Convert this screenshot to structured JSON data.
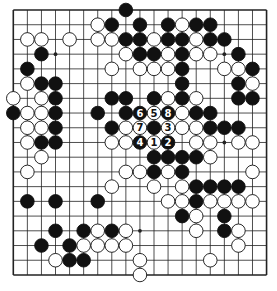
{
  "diagram": {
    "type": "go-board",
    "size": 19,
    "colors": {
      "line": "#222222",
      "black_stone": "#111111",
      "white_stone": "#ffffff",
      "background": "#ffffff"
    },
    "hoshi": [
      [
        3,
        3
      ],
      [
        3,
        9
      ],
      [
        3,
        15
      ],
      [
        9,
        3
      ],
      [
        9,
        9
      ],
      [
        9,
        15
      ],
      [
        15,
        3
      ],
      [
        15,
        9
      ],
      [
        15,
        15
      ]
    ],
    "stones": [
      {
        "r": 0,
        "c": 8,
        "color": "B"
      },
      {
        "r": 1,
        "c": 6,
        "color": "W"
      },
      {
        "r": 1,
        "c": 7,
        "color": "B"
      },
      {
        "r": 1,
        "c": 9,
        "color": "B"
      },
      {
        "r": 1,
        "c": 11,
        "color": "B"
      },
      {
        "r": 1,
        "c": 12,
        "color": "W"
      },
      {
        "r": 1,
        "c": 13,
        "color": "B"
      },
      {
        "r": 1,
        "c": 14,
        "color": "B"
      },
      {
        "r": 2,
        "c": 1,
        "color": "W"
      },
      {
        "r": 2,
        "c": 2,
        "color": "W"
      },
      {
        "r": 2,
        "c": 4,
        "color": "W"
      },
      {
        "r": 2,
        "c": 6,
        "color": "W"
      },
      {
        "r": 2,
        "c": 7,
        "color": "W"
      },
      {
        "r": 2,
        "c": 8,
        "color": "B"
      },
      {
        "r": 2,
        "c": 9,
        "color": "B"
      },
      {
        "r": 2,
        "c": 10,
        "color": "W"
      },
      {
        "r": 2,
        "c": 11,
        "color": "B"
      },
      {
        "r": 2,
        "c": 12,
        "color": "B"
      },
      {
        "r": 2,
        "c": 13,
        "color": "W"
      },
      {
        "r": 2,
        "c": 14,
        "color": "B"
      },
      {
        "r": 2,
        "c": 15,
        "color": "B"
      },
      {
        "r": 3,
        "c": 2,
        "color": "B"
      },
      {
        "r": 3,
        "c": 8,
        "color": "W"
      },
      {
        "r": 3,
        "c": 9,
        "color": "B"
      },
      {
        "r": 3,
        "c": 10,
        "color": "B"
      },
      {
        "r": 3,
        "c": 11,
        "color": "W"
      },
      {
        "r": 3,
        "c": 12,
        "color": "B"
      },
      {
        "r": 3,
        "c": 13,
        "color": "W"
      },
      {
        "r": 3,
        "c": 14,
        "color": "W"
      },
      {
        "r": 3,
        "c": 16,
        "color": "B"
      },
      {
        "r": 4,
        "c": 1,
        "color": "B"
      },
      {
        "r": 4,
        "c": 7,
        "color": "W"
      },
      {
        "r": 4,
        "c": 9,
        "color": "W"
      },
      {
        "r": 4,
        "c": 10,
        "color": "W"
      },
      {
        "r": 4,
        "c": 11,
        "color": "W"
      },
      {
        "r": 4,
        "c": 12,
        "color": "B"
      },
      {
        "r": 4,
        "c": 15,
        "color": "W"
      },
      {
        "r": 4,
        "c": 16,
        "color": "W"
      },
      {
        "r": 4,
        "c": 17,
        "color": "B"
      },
      {
        "r": 5,
        "c": 1,
        "color": "W"
      },
      {
        "r": 5,
        "c": 2,
        "color": "B"
      },
      {
        "r": 5,
        "c": 3,
        "color": "B"
      },
      {
        "r": 5,
        "c": 12,
        "color": "B"
      },
      {
        "r": 5,
        "c": 16,
        "color": "B"
      },
      {
        "r": 5,
        "c": 17,
        "color": "W"
      },
      {
        "r": 6,
        "c": 0,
        "color": "W"
      },
      {
        "r": 6,
        "c": 2,
        "color": "W"
      },
      {
        "r": 6,
        "c": 3,
        "color": "B"
      },
      {
        "r": 6,
        "c": 7,
        "color": "B"
      },
      {
        "r": 6,
        "c": 8,
        "color": "B"
      },
      {
        "r": 6,
        "c": 10,
        "color": "B"
      },
      {
        "r": 6,
        "c": 11,
        "color": "W"
      },
      {
        "r": 6,
        "c": 12,
        "color": "B"
      },
      {
        "r": 6,
        "c": 13,
        "color": "W"
      },
      {
        "r": 6,
        "c": 16,
        "color": "B"
      },
      {
        "r": 6,
        "c": 17,
        "color": "B"
      },
      {
        "r": 7,
        "c": 0,
        "color": "B"
      },
      {
        "r": 7,
        "c": 1,
        "color": "W"
      },
      {
        "r": 7,
        "c": 2,
        "color": "W"
      },
      {
        "r": 7,
        "c": 3,
        "color": "B"
      },
      {
        "r": 7,
        "c": 6,
        "color": "B"
      },
      {
        "r": 7,
        "c": 8,
        "color": "B"
      },
      {
        "r": 7,
        "c": 9,
        "color": "B",
        "label": "6"
      },
      {
        "r": 7,
        "c": 10,
        "color": "W",
        "label": "5"
      },
      {
        "r": 7,
        "c": 11,
        "color": "B",
        "label": "8"
      },
      {
        "r": 7,
        "c": 12,
        "color": "W"
      },
      {
        "r": 7,
        "c": 13,
        "color": "B"
      },
      {
        "r": 7,
        "c": 14,
        "color": "B"
      },
      {
        "r": 8,
        "c": 1,
        "color": "W"
      },
      {
        "r": 8,
        "c": 2,
        "color": "W"
      },
      {
        "r": 8,
        "c": 3,
        "color": "B"
      },
      {
        "r": 8,
        "c": 7,
        "color": "B"
      },
      {
        "r": 8,
        "c": 8,
        "color": "W"
      },
      {
        "r": 8,
        "c": 9,
        "color": "W",
        "label": "7"
      },
      {
        "r": 8,
        "c": 10,
        "color": "B"
      },
      {
        "r": 8,
        "c": 11,
        "color": "W",
        "label": "3"
      },
      {
        "r": 8,
        "c": 12,
        "color": "W"
      },
      {
        "r": 8,
        "c": 13,
        "color": "W"
      },
      {
        "r": 8,
        "c": 14,
        "color": "B"
      },
      {
        "r": 8,
        "c": 15,
        "color": "B"
      },
      {
        "r": 8,
        "c": 16,
        "color": "B"
      },
      {
        "r": 9,
        "c": 1,
        "color": "W"
      },
      {
        "r": 9,
        "c": 2,
        "color": "B"
      },
      {
        "r": 9,
        "c": 3,
        "color": "B"
      },
      {
        "r": 9,
        "c": 7,
        "color": "W"
      },
      {
        "r": 9,
        "c": 8,
        "color": "W"
      },
      {
        "r": 9,
        "c": 9,
        "color": "B",
        "label": "4"
      },
      {
        "r": 9,
        "c": 10,
        "color": "W",
        "label": "1"
      },
      {
        "r": 9,
        "c": 11,
        "color": "B",
        "label": "2"
      },
      {
        "r": 9,
        "c": 13,
        "color": "W"
      },
      {
        "r": 9,
        "c": 14,
        "color": "W"
      },
      {
        "r": 9,
        "c": 16,
        "color": "W"
      },
      {
        "r": 9,
        "c": 17,
        "color": "W"
      },
      {
        "r": 10,
        "c": 2,
        "color": "W"
      },
      {
        "r": 10,
        "c": 10,
        "color": "B"
      },
      {
        "r": 10,
        "c": 11,
        "color": "B"
      },
      {
        "r": 10,
        "c": 12,
        "color": "B"
      },
      {
        "r": 10,
        "c": 13,
        "color": "B"
      },
      {
        "r": 10,
        "c": 14,
        "color": "W"
      },
      {
        "r": 11,
        "c": 1,
        "color": "W"
      },
      {
        "r": 11,
        "c": 8,
        "color": "W"
      },
      {
        "r": 11,
        "c": 9,
        "color": "W"
      },
      {
        "r": 11,
        "c": 10,
        "color": "B"
      },
      {
        "r": 11,
        "c": 11,
        "color": "W"
      },
      {
        "r": 11,
        "c": 12,
        "color": "B"
      },
      {
        "r": 11,
        "c": 17,
        "color": "W"
      },
      {
        "r": 12,
        "c": 7,
        "color": "W"
      },
      {
        "r": 12,
        "c": 10,
        "color": "W"
      },
      {
        "r": 12,
        "c": 12,
        "color": "W"
      },
      {
        "r": 12,
        "c": 13,
        "color": "B"
      },
      {
        "r": 12,
        "c": 14,
        "color": "B"
      },
      {
        "r": 12,
        "c": 15,
        "color": "B"
      },
      {
        "r": 12,
        "c": 16,
        "color": "B"
      },
      {
        "r": 13,
        "c": 1,
        "color": "B"
      },
      {
        "r": 13,
        "c": 3,
        "color": "B"
      },
      {
        "r": 13,
        "c": 6,
        "color": "B"
      },
      {
        "r": 13,
        "c": 11,
        "color": "W"
      },
      {
        "r": 13,
        "c": 12,
        "color": "W"
      },
      {
        "r": 13,
        "c": 13,
        "color": "B"
      },
      {
        "r": 13,
        "c": 14,
        "color": "W"
      },
      {
        "r": 13,
        "c": 15,
        "color": "W"
      },
      {
        "r": 13,
        "c": 16,
        "color": "W"
      },
      {
        "r": 13,
        "c": 17,
        "color": "W"
      },
      {
        "r": 14,
        "c": 12,
        "color": "B"
      },
      {
        "r": 14,
        "c": 13,
        "color": "W"
      },
      {
        "r": 14,
        "c": 15,
        "color": "B"
      },
      {
        "r": 15,
        "c": 3,
        "color": "B"
      },
      {
        "r": 15,
        "c": 5,
        "color": "B"
      },
      {
        "r": 15,
        "c": 6,
        "color": "W"
      },
      {
        "r": 15,
        "c": 7,
        "color": "B"
      },
      {
        "r": 15,
        "c": 8,
        "color": "W"
      },
      {
        "r": 15,
        "c": 13,
        "color": "W"
      },
      {
        "r": 15,
        "c": 15,
        "color": "B"
      },
      {
        "r": 15,
        "c": 16,
        "color": "W"
      },
      {
        "r": 16,
        "c": 2,
        "color": "B"
      },
      {
        "r": 16,
        "c": 4,
        "color": "B"
      },
      {
        "r": 16,
        "c": 5,
        "color": "W"
      },
      {
        "r": 16,
        "c": 6,
        "color": "W"
      },
      {
        "r": 16,
        "c": 7,
        "color": "W"
      },
      {
        "r": 16,
        "c": 8,
        "color": "W"
      },
      {
        "r": 16,
        "c": 16,
        "color": "W"
      },
      {
        "r": 17,
        "c": 3,
        "color": "W"
      },
      {
        "r": 17,
        "c": 4,
        "color": "B"
      },
      {
        "r": 17,
        "c": 5,
        "color": "B"
      },
      {
        "r": 17,
        "c": 9,
        "color": "W"
      },
      {
        "r": 17,
        "c": 14,
        "color": "W"
      },
      {
        "r": 18,
        "c": 9,
        "color": "W"
      }
    ],
    "move_labels": [
      "1",
      "2",
      "3",
      "4",
      "5",
      "6",
      "7",
      "8"
    ]
  }
}
